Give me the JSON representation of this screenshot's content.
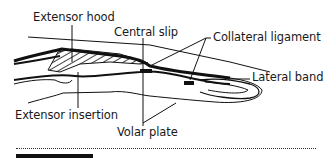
{
  "diagram": {
    "labels": {
      "extensor_hood": "Extensor hood",
      "central_slip": "Central slip",
      "collateral_ligament": "Collateral ligament",
      "lateral_band": "Lateral band",
      "extensor_insertion": "Extensor insertion",
      "volar_plate": "Volar plate"
    },
    "colors": {
      "ink": "#1a1a1a",
      "background": "#ffffff"
    }
  }
}
